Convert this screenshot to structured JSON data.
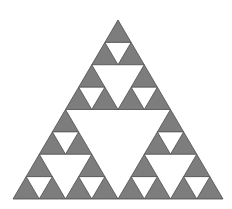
{
  "figure": {
    "title": "Sierpinski Triangle",
    "background_color": "#ffffff",
    "fill_color": "#7d7d7d",
    "stroke_color": "#4a4a4a",
    "stroke_width": 0.8,
    "canvas": {
      "width": 232,
      "height": 209
    },
    "geometry": {
      "shape": "equilateral-triangle",
      "apex": {
        "x": 118,
        "y": 20
      },
      "bottom_left": {
        "x": 13,
        "y": 199
      },
      "bottom_right": {
        "x": 223,
        "y": 199
      },
      "base_width": 210,
      "height": 179,
      "iteration_depth": 3,
      "filled_triangle_count": 27,
      "holes": [
        {
          "level": 1,
          "count": 1,
          "description": "central inverted triangle"
        },
        {
          "level": 2,
          "count": 3,
          "description": "inverted triangles in each corner sub-triangle"
        },
        {
          "level": 3,
          "count": 9,
          "description": "inverted triangles in each second-level sub-triangle"
        }
      ],
      "bottom_row_triangle_count": 8
    }
  }
}
